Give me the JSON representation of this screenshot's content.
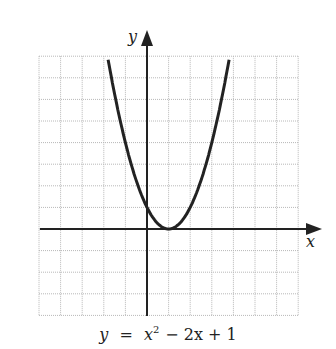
{
  "chart_data": {
    "type": "line",
    "equation": {
      "y": "y",
      "eq": "=",
      "x": "x",
      "sup": "2",
      "rest": "− 2x + 1"
    },
    "xlabel": "x",
    "ylabel": "y",
    "xlim": [
      -5,
      7
    ],
    "ylim": [
      -4,
      8
    ],
    "grid": true,
    "function": "x^2 - 2x + 1",
    "vertex": [
      1,
      0
    ],
    "x": [
      -1.8,
      -1,
      0,
      1,
      2,
      3,
      3.8
    ],
    "values": [
      7.84,
      4,
      1,
      0,
      1,
      4,
      7.84
    ]
  },
  "labels": {
    "x_axis": "x",
    "y_axis": "y"
  },
  "colors": {
    "curve": "#222222",
    "grid": "#b8b8b8",
    "axis": "#222222"
  }
}
